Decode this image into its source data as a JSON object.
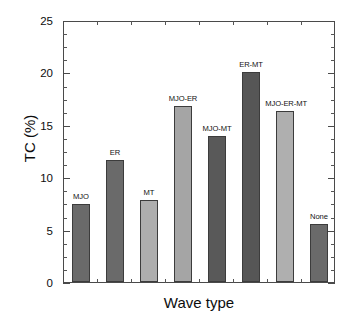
{
  "chart_data": {
    "type": "bar",
    "title": "",
    "xlabel": "Wave type",
    "ylabel": "TC (%)",
    "categories": [
      "MJO",
      "ER",
      "MT",
      "MJO-ER",
      "MJO-MT",
      "ER-MT",
      "MJO-ER-MT",
      "None"
    ],
    "values": [
      7.4,
      11.6,
      7.8,
      16.8,
      13.9,
      20.0,
      16.3,
      5.5
    ],
    "bar_colors": [
      "#6a6a6a",
      "#6a6a6a",
      "#aeaeae",
      "#a5a5a5",
      "#595959",
      "#565656",
      "#afafaf",
      "#6a6a6a"
    ],
    "bar_labels": [
      "MJO",
      "ER",
      "MT",
      "MJO-ER",
      "MJO-MT",
      "ER-MT",
      "MJO-ER-MT",
      "None"
    ],
    "ylim": [
      0,
      25
    ],
    "ytick_labels": [
      "0",
      "5",
      "10",
      "15",
      "20",
      "25"
    ],
    "ytick_values": [
      0,
      5,
      10,
      15,
      20,
      25
    ],
    "yminor_step": 1.25,
    "grid": false,
    "legend": "none",
    "axis_color": "#4a4a4a"
  },
  "axis": {
    "x_title": "Wave type",
    "y_title": "TC (%)"
  },
  "ticks": {
    "y": [
      {
        "label": "25",
        "value": 25
      },
      {
        "label": "20",
        "value": 20
      },
      {
        "label": "15",
        "value": 15
      },
      {
        "label": "10",
        "value": 10
      },
      {
        "label": "5",
        "value": 5
      },
      {
        "label": "0",
        "value": 0
      }
    ]
  }
}
